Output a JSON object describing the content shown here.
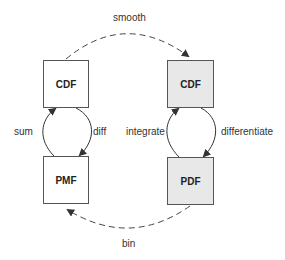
{
  "nodes": {
    "discrete_cdf": {
      "label": "CDF",
      "fill": "#ffffff"
    },
    "pmf": {
      "label": "PMF",
      "fill": "#ffffff"
    },
    "continuous_cdf": {
      "label": "CDF",
      "fill": "#e8e8e8"
    },
    "pdf": {
      "label": "PDF",
      "fill": "#e8e8e8"
    }
  },
  "edges": {
    "smooth": "smooth",
    "bin": "bin",
    "sum": "sum",
    "diff": "diff",
    "integrate": "integrate",
    "differentiate": "differentiate"
  }
}
